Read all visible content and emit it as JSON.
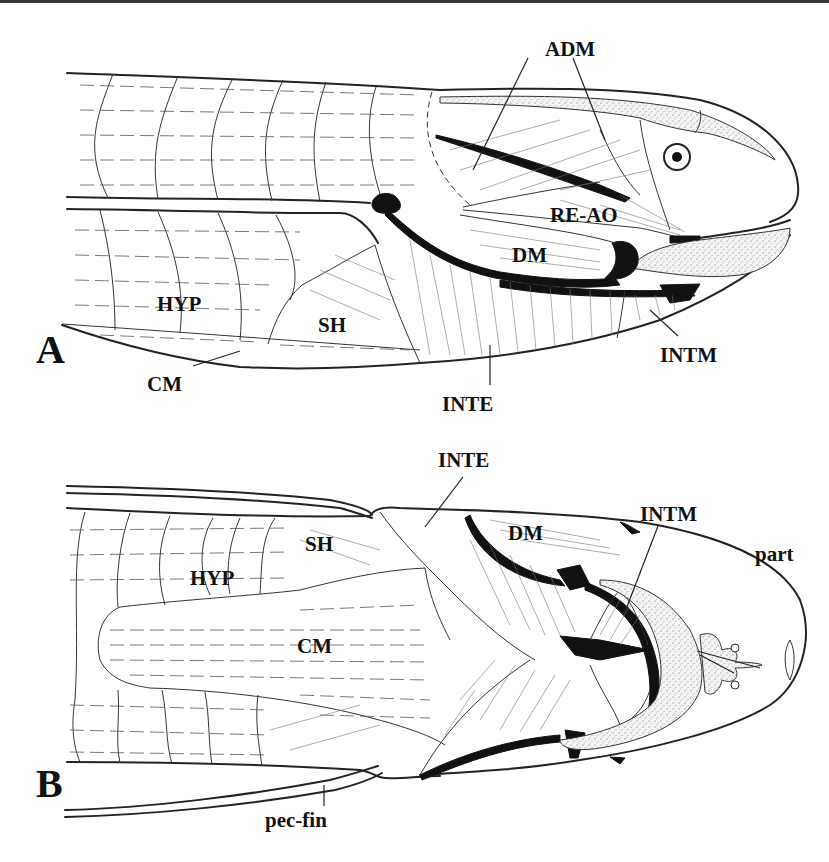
{
  "figure": {
    "panels": [
      {
        "id": "A",
        "label": "A",
        "view": "lateral",
        "part_labels": {
          "adm": "ADM",
          "re_ao": "RE-AO",
          "dm": "DM",
          "hyp": "HYP",
          "sh": "SH",
          "intm": "INTM",
          "cm": "CM",
          "inte": "INTE"
        }
      },
      {
        "id": "B",
        "label": "B",
        "view": "ventral",
        "part_labels": {
          "inte": "INTE",
          "dm": "DM",
          "intm": "INTM",
          "sh": "SH",
          "hyp": "HYP",
          "part": "part",
          "cm": "CM",
          "pec_fin": "pec-fin"
        }
      }
    ]
  }
}
